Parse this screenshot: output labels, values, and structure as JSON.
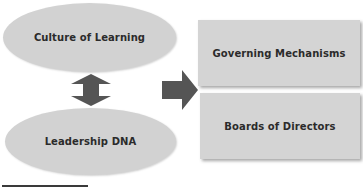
{
  "diagram": {
    "ellipses": [
      {
        "id": "culture",
        "label": "Culture of Learning"
      },
      {
        "id": "leadership",
        "label": "Leadership DNA"
      }
    ],
    "boxes": [
      {
        "id": "governing",
        "label": "Governing Mechanisms"
      },
      {
        "id": "boards",
        "label": "Boards of Directors"
      }
    ],
    "connectors": [
      {
        "type": "double-arrow-vertical",
        "between": [
          "Culture of Learning",
          "Leadership DNA"
        ]
      },
      {
        "type": "arrow-right",
        "from": "ellipses",
        "to": "boxes"
      }
    ],
    "colors": {
      "shape_fill": "#d2d2d2",
      "arrow_fill": "#555555",
      "text": "#2b2b2b"
    }
  }
}
